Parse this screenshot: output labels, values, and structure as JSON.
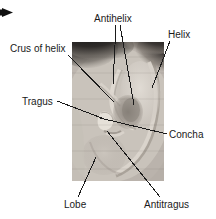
{
  "figure": {
    "kind": "anatomical-photo-diagram",
    "background_color": "#ffffff",
    "text_color": "#1a1a1a",
    "leader_color": "#1a1a1a",
    "photo": {
      "name": "ear-photograph",
      "x": 72,
      "y": 42,
      "width": 92,
      "height": 139,
      "description": "grayscale close-up photograph of a right external ear with dark hair at upper left and upper right corners"
    },
    "marker": {
      "name": "corner-arrow-marker",
      "glyph": "solid right-pointing triangle",
      "x": 2,
      "y": 8,
      "width": 11,
      "height": 9
    },
    "labels": [
      {
        "id": "antihelix",
        "text": "Antihelix",
        "x": 94,
        "y": 13,
        "leaders": [
          {
            "x1": 116,
            "y1": 25,
            "x2": 113,
            "y2": 84
          },
          {
            "x1": 120,
            "y1": 25,
            "x2": 134,
            "y2": 105
          }
        ]
      },
      {
        "id": "helix",
        "text": "Helix",
        "x": 168,
        "y": 29,
        "leaders": [
          {
            "x1": 170,
            "y1": 41,
            "x2": 152,
            "y2": 88
          }
        ]
      },
      {
        "id": "crus-of-helix",
        "text": "Crus of helix",
        "x": 10,
        "y": 43,
        "leaders": [
          {
            "x1": 68,
            "y1": 55,
            "x2": 114,
            "y2": 102
          }
        ]
      },
      {
        "id": "tragus",
        "text": "Tragus",
        "x": 22,
        "y": 96,
        "leaders": [
          {
            "x1": 57,
            "y1": 101,
            "x2": 107,
            "y2": 120
          }
        ]
      },
      {
        "id": "concha",
        "text": "Concha",
        "x": 169,
        "y": 129,
        "leaders": [
          {
            "x1": 167,
            "y1": 134,
            "x2": 100,
            "y2": 118
          }
        ]
      },
      {
        "id": "lobe",
        "text": "Lobe",
        "x": 64,
        "y": 199,
        "leaders": [
          {
            "x1": 78,
            "y1": 197,
            "x2": 96,
            "y2": 157
          }
        ]
      },
      {
        "id": "antitragus",
        "text": "Antitragus",
        "x": 144,
        "y": 199,
        "leaders": [
          {
            "x1": 160,
            "y1": 197,
            "x2": 107,
            "y2": 131
          }
        ]
      }
    ]
  }
}
